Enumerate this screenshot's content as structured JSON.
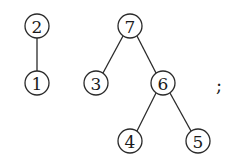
{
  "diagram": {
    "type": "forest",
    "trees": [
      {
        "root": "2",
        "nodes": [
          {
            "id": "2",
            "label": "2",
            "x": 37,
            "y": 26
          },
          {
            "id": "1",
            "label": "1",
            "x": 37,
            "y": 83
          }
        ],
        "edges": [
          [
            "2",
            "1"
          ]
        ]
      },
      {
        "root": "7",
        "nodes": [
          {
            "id": "7",
            "label": "7",
            "x": 130,
            "y": 26
          },
          {
            "id": "3",
            "label": "3",
            "x": 96,
            "y": 83
          },
          {
            "id": "6",
            "label": "6",
            "x": 163,
            "y": 83
          },
          {
            "id": "4",
            "label": "4",
            "x": 130,
            "y": 141
          },
          {
            "id": "5",
            "label": "5",
            "x": 198,
            "y": 141
          }
        ],
        "edges": [
          [
            "7",
            "3"
          ],
          [
            "7",
            "6"
          ],
          [
            "6",
            "4"
          ],
          [
            "6",
            "5"
          ]
        ]
      }
    ],
    "trailing_punctuation": ";"
  }
}
